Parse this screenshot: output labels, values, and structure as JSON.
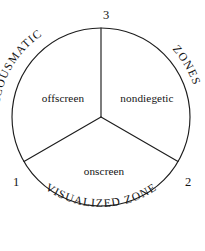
{
  "diagram": {
    "type": "venn-style-pie-zone-diagram",
    "background_color": "#ffffff",
    "stroke_color": "#1d1d1d",
    "text_color": "#141414",
    "circle": {
      "center_x": 101,
      "center_y": 117,
      "radius": 89
    },
    "sectors": [
      {
        "id": "offscreen",
        "label": "offscreen",
        "position": "upper-left",
        "label_x": 63,
        "label_y": 99
      },
      {
        "id": "nondiegetic",
        "label": "nondiegetic",
        "position": "upper-right",
        "label_x": 147,
        "label_y": 99
      },
      {
        "id": "onscreen",
        "label": "onscreen",
        "position": "bottom",
        "label_x": 104,
        "label_y": 172
      }
    ],
    "vertices": [
      {
        "id": "vertex-1",
        "label": "1",
        "position": "lower-left",
        "x": 16,
        "y": 183
      },
      {
        "id": "vertex-2",
        "label": "2",
        "position": "lower-right",
        "x": 188,
        "y": 183
      },
      {
        "id": "vertex-3",
        "label": "3",
        "position": "top",
        "x": 106,
        "y": 16
      }
    ],
    "arc_labels": [
      {
        "id": "acousmatic",
        "label": "ACOUSMATIC",
        "position": "upper-left-arc",
        "path_id": "arc-path-acousmatic",
        "start_offset": "50%"
      },
      {
        "id": "zones",
        "label": "ZONES",
        "position": "upper-right-arc",
        "path_id": "arc-path-zones",
        "start_offset": "50%"
      },
      {
        "id": "visualized-zone",
        "label": "VISUALIZED ZONE",
        "position": "bottom-arc",
        "path_id": "arc-path-visualized",
        "start_offset": "50%"
      }
    ]
  }
}
